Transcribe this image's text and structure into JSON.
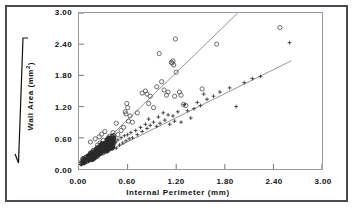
{
  "figure": {
    "background_color": "#ffffff",
    "border_color": "#4a4a52",
    "plot_frame_color": "#9a9a9a"
  },
  "axes": {
    "x_title": "Internal  Perimeter  (mm)",
    "y_title_main": "Wall  Area",
    "y_title_units": "(mm",
    "y_title_exponent": "2",
    "y_title_close": ")",
    "y_title_full": "Wall Area (mm2)",
    "radical_icon": "square-root-icon",
    "x_ticks": [
      "0.00",
      "0.60",
      "1.20",
      "1.80",
      "2.40",
      "3.00"
    ],
    "y_ticks": [
      "0.00",
      "0.60",
      "1.20",
      "1.80",
      "2.40",
      "3.00"
    ]
  },
  "chart_data": {
    "type": "scatter",
    "title": "",
    "subtitle": "",
    "xlabel": "Internal Perimeter (mm)",
    "ylabel": "sqrt(Wall Area) (mm^2)",
    "xlim": [
      0.0,
      3.0
    ],
    "ylim": [
      0.0,
      3.0
    ],
    "xticks": [
      0.0,
      0.6,
      1.2,
      1.8,
      2.4,
      3.0
    ],
    "yticks": [
      0.0,
      0.6,
      1.2,
      1.8,
      2.4,
      3.0
    ],
    "grid": false,
    "legend": null,
    "legend_position": "none",
    "marker_colors": {
      "circles": "#555555",
      "pluses": "#333333"
    },
    "line_color": "#8a8a8a",
    "series": [
      {
        "name": "open-circle-series",
        "marker": "circle-open",
        "color": "#555555",
        "points": [
          [
            0.14,
            0.52
          ],
          [
            0.2,
            0.58
          ],
          [
            0.23,
            0.46
          ],
          [
            0.25,
            0.62
          ],
          [
            0.26,
            0.5
          ],
          [
            0.28,
            0.67
          ],
          [
            0.3,
            0.55
          ],
          [
            0.32,
            0.72
          ],
          [
            0.34,
            0.48
          ],
          [
            0.36,
            0.6
          ],
          [
            0.38,
            0.63
          ],
          [
            0.4,
            0.58
          ],
          [
            0.42,
            0.7
          ],
          [
            0.44,
            0.52
          ],
          [
            0.46,
            0.88
          ],
          [
            0.48,
            0.66
          ],
          [
            0.52,
            0.74
          ],
          [
            0.55,
            0.8
          ],
          [
            0.57,
            1.1
          ],
          [
            0.58,
            1.06
          ],
          [
            0.59,
            1.26
          ],
          [
            0.6,
            1.18
          ],
          [
            0.61,
            0.92
          ],
          [
            0.63,
            1.02
          ],
          [
            0.66,
            0.9
          ],
          [
            0.72,
            1.08
          ],
          [
            0.78,
            1.46
          ],
          [
            0.82,
            1.5
          ],
          [
            0.84,
            1.44
          ],
          [
            0.86,
            1.26
          ],
          [
            0.88,
            1.4
          ],
          [
            0.92,
            1.18
          ],
          [
            0.96,
            1.58
          ],
          [
            0.99,
            2.22
          ],
          [
            1.02,
            1.68
          ],
          [
            1.05,
            1.52
          ],
          [
            1.08,
            1.42
          ],
          [
            1.1,
            1.48
          ],
          [
            1.14,
            2.05
          ],
          [
            1.15,
            2.04
          ],
          [
            1.16,
            2.08
          ],
          [
            1.17,
            2.0
          ],
          [
            1.18,
            1.4
          ],
          [
            1.19,
            2.5
          ],
          [
            1.2,
            1.86
          ],
          [
            1.24,
            1.48
          ],
          [
            1.26,
            1.42
          ],
          [
            1.29,
            1.24
          ],
          [
            1.32,
            1.22
          ],
          [
            1.52,
            1.54
          ],
          [
            1.7,
            2.4
          ],
          [
            2.48,
            2.72
          ]
        ]
      },
      {
        "name": "plus-series",
        "marker": "plus",
        "color": "#333333",
        "points": [
          [
            0.3,
            0.42
          ],
          [
            0.33,
            0.38
          ],
          [
            0.36,
            0.46
          ],
          [
            0.38,
            0.4
          ],
          [
            0.4,
            0.48
          ],
          [
            0.42,
            0.44
          ],
          [
            0.44,
            0.52
          ],
          [
            0.46,
            0.4
          ],
          [
            0.48,
            0.56
          ],
          [
            0.5,
            0.46
          ],
          [
            0.52,
            0.6
          ],
          [
            0.54,
            0.5
          ],
          [
            0.56,
            0.64
          ],
          [
            0.58,
            0.54
          ],
          [
            0.6,
            0.66
          ],
          [
            0.62,
            0.58
          ],
          [
            0.64,
            0.7
          ],
          [
            0.66,
            0.6
          ],
          [
            0.7,
            0.74
          ],
          [
            0.72,
            0.66
          ],
          [
            0.76,
            0.8
          ],
          [
            0.78,
            0.72
          ],
          [
            0.82,
            0.86
          ],
          [
            0.84,
            0.78
          ],
          [
            0.86,
            0.96
          ],
          [
            0.88,
            0.84
          ],
          [
            0.92,
            0.9
          ],
          [
            0.96,
            0.82
          ],
          [
            0.98,
            1.0
          ],
          [
            1.0,
            0.88
          ],
          [
            1.04,
            1.08
          ],
          [
            1.06,
            0.94
          ],
          [
            1.1,
            1.04
          ],
          [
            1.12,
            0.86
          ],
          [
            1.16,
            1.02
          ],
          [
            1.18,
            0.92
          ],
          [
            1.22,
            1.1
          ],
          [
            1.26,
            0.9
          ],
          [
            1.3,
            1.24
          ],
          [
            1.34,
            1.12
          ],
          [
            1.38,
            0.98
          ],
          [
            1.42,
            1.16
          ],
          [
            1.46,
            1.28
          ],
          [
            1.5,
            1.22
          ],
          [
            1.54,
            1.44
          ],
          [
            1.58,
            1.34
          ],
          [
            1.66,
            1.4
          ],
          [
            1.74,
            1.48
          ],
          [
            1.86,
            1.56
          ],
          [
            1.94,
            1.2
          ],
          [
            2.04,
            1.66
          ],
          [
            2.14,
            1.74
          ],
          [
            2.24,
            1.78
          ],
          [
            2.6,
            2.43
          ]
        ]
      },
      {
        "name": "dense-origin-cluster",
        "marker": "mixed-dense",
        "color": "#2b2b2b",
        "note": "large dense cluster of both markers between x=0.02 and x=0.45, y=0.10 to 0.55"
      }
    ],
    "fit_lines": [
      {
        "name": "upper-regression-line",
        "for_series": "open-circle-series",
        "x0": 0.05,
        "y0": 0.12,
        "x1": 1.96,
        "y1": 3.0,
        "color": "#8a8a8a"
      },
      {
        "name": "lower-regression-line",
        "for_series": "plus-series",
        "x0": 0.05,
        "y0": 0.1,
        "x1": 2.62,
        "y1": 2.08,
        "color": "#8a8a8a"
      }
    ]
  }
}
